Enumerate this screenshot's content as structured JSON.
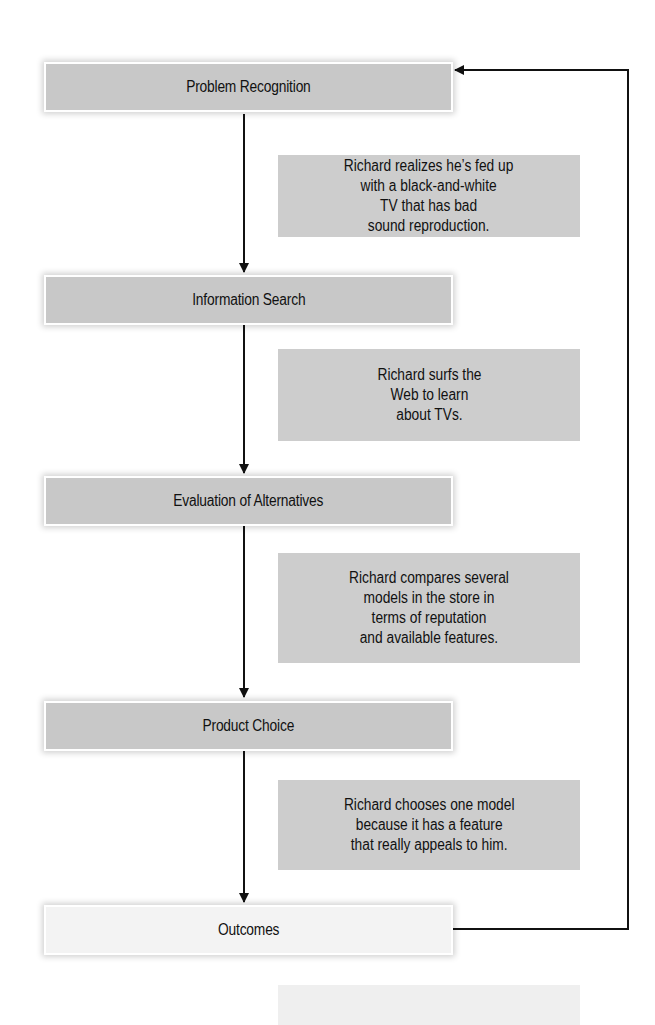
{
  "diagram": {
    "type": "flowchart",
    "steps": [
      {
        "label": "Problem Recognition"
      },
      {
        "label": "Information Search"
      },
      {
        "label": "Evaluation of Alternatives"
      },
      {
        "label": "Product Choice"
      },
      {
        "label": "Outcomes"
      }
    ],
    "notes": [
      {
        "text": "Richard realizes he’s fed up\nwith a black-and-white\nTV that has bad\nsound reproduction."
      },
      {
        "text": "Richard surfs the\nWeb to learn\nabout TVs."
      },
      {
        "text": "Richard compares several\nmodels in the store in\nterms of reputation\nand available features."
      },
      {
        "text": "Richard chooses one model\nbecause it has a feature\nthat really appeals to him."
      },
      {
        "text": ""
      }
    ],
    "feedback_loop": {
      "from": "Outcomes",
      "to": "Problem Recognition"
    },
    "colors": {
      "step_fill": "#c8c8c8",
      "outcome_fill": "#f3f3f3",
      "note_fill": "#cdcdcd",
      "line": "#111111"
    }
  }
}
